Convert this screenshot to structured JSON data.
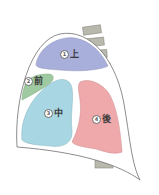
{
  "diagram": {
    "regions": [
      {
        "id": "upper",
        "number": "1",
        "label": "上",
        "color": "#a9afdb"
      },
      {
        "id": "anterior",
        "number": "2",
        "label": "前",
        "color": "#9fc9a0"
      },
      {
        "id": "middle",
        "number": "3",
        "label": "中",
        "color": "#a8d6e2"
      },
      {
        "id": "posterior",
        "number": "4",
        "label": "後",
        "color": "#f0a9ab"
      }
    ],
    "vertebra_color": "#b9b8ad",
    "outline_color": "#6f6f6f"
  }
}
